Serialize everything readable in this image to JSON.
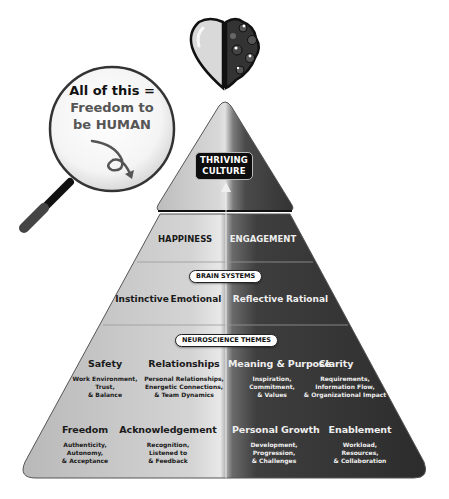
{
  "magnifier": {
    "line1": "All of this =",
    "line2": "Freedom to",
    "line3": "be HUMAN",
    "icon": "curly-arrow-icon"
  },
  "top_icon": "heart-brain-icon",
  "pyramid": {
    "apex": {
      "label_line1": "THRIVING",
      "label_line2": "CULTURE"
    },
    "tier2": {
      "left": "HAPPINESS",
      "right": "ENGAGEMENT"
    },
    "tier3": {
      "badge": "BRAIN SYSTEMS",
      "items": [
        "Instinctive",
        "Emotional",
        "Reflective",
        "Rational"
      ]
    },
    "tier4": {
      "badge": "NEUROSCIENCE THEMES",
      "themes": [
        {
          "title": "Safety",
          "lines": [
            "Work Environment,",
            "Trust,",
            "& Balance"
          ]
        },
        {
          "title": "Relationships",
          "lines": [
            "Personal Relationships,",
            "Energetic Connections,",
            "& Team Dynamics"
          ]
        },
        {
          "title": "Meaning & Purpose",
          "lines": [
            "Inspiration,",
            "Commitment,",
            "& Values"
          ]
        },
        {
          "title": "Clarity",
          "lines": [
            "Requirements,",
            "Information Flow,",
            "& Organizational Impact"
          ]
        },
        {
          "title": "Freedom",
          "lines": [
            "Authenticity,",
            "Autonomy,",
            "& Acceptance"
          ]
        },
        {
          "title": "Acknowledgement",
          "lines": [
            "Recognition,",
            "Listened to",
            "& Feedback"
          ]
        },
        {
          "title": "Personal Growth",
          "lines": [
            "Development,",
            "Progression,",
            "& Challenges"
          ]
        },
        {
          "title": "Enablement",
          "lines": [
            "Workload,",
            "Resources,",
            "& Collaboration"
          ]
        }
      ]
    }
  },
  "colors": {
    "light_side": "#c8c8c8",
    "dark_side": "#3a3a3a",
    "badge_bg": "#ffffff",
    "thrive_bg": "#0d0d0d"
  }
}
